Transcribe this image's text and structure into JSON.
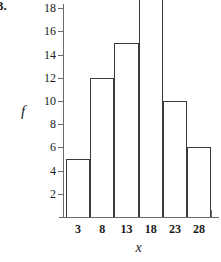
{
  "item_number": "3.",
  "chart_data": {
    "type": "bar",
    "title": "",
    "xlabel": "x",
    "ylabel": "f",
    "categories": [
      "3",
      "8",
      "13",
      "18",
      "23",
      "28"
    ],
    "values": [
      5,
      12,
      15,
      20,
      10,
      6
    ],
    "bin_edges": [
      0.5,
      5.5,
      10.5,
      15.5,
      20.5,
      25.5,
      30.5
    ],
    "ylim": [
      0,
      21
    ],
    "y_ticks": [
      2,
      4,
      6,
      8,
      10,
      12,
      14,
      16,
      18,
      20
    ],
    "y_tick_labels": [
      "2",
      "4",
      "6",
      "8",
      "10",
      "12",
      "14",
      "16",
      "18",
      "20"
    ],
    "x_tick_labels": [
      "3",
      "8",
      "13",
      "18",
      "23",
      "28"
    ],
    "grid": false,
    "legend": false,
    "bar_fill": "none",
    "bar_edge_color": "#3a3a3a",
    "axis_color": "#6a6a6a",
    "background": "#ffffff"
  }
}
